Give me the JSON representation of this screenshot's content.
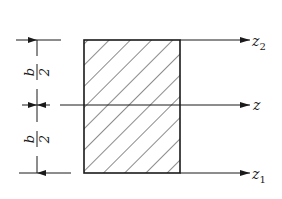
{
  "diagram": {
    "type": "rectangular-cross-section",
    "colors": {
      "line": "#1a1a1a",
      "background": "#ffffff"
    },
    "axes": [
      {
        "id": "z2",
        "name": "z",
        "subscript": "2",
        "position": "top-edge"
      },
      {
        "id": "z",
        "name": "z",
        "subscript": "",
        "position": "centroid"
      },
      {
        "id": "z1",
        "name": "z",
        "subscript": "1",
        "position": "bottom-edge"
      }
    ],
    "dimensions": [
      {
        "id": "upper-half",
        "numerator": "b",
        "denominator": "2"
      },
      {
        "id": "lower-half",
        "numerator": "b",
        "denominator": "2"
      }
    ],
    "shape": {
      "kind": "rectangle",
      "fill": "hatched-diagonal"
    }
  }
}
